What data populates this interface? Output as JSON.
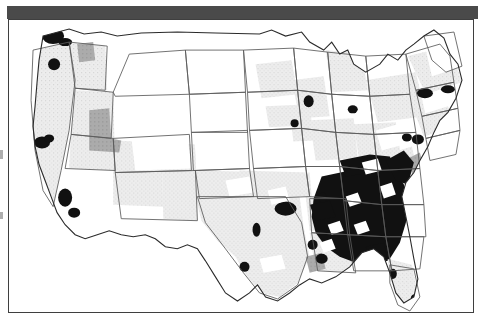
{
  "figure": {
    "kind": "choropleth-map",
    "region": "Contiguous United States",
    "unit": "county",
    "title": "",
    "caption": ""
  },
  "frame": {
    "top_bar_color": "#4a4a4a",
    "border_color": "#3f3f3f",
    "background_color": "#ffffff"
  },
  "chart_data": {
    "type": "heatmap",
    "title": "",
    "xlabel": "",
    "ylabel": "",
    "legend_position": "none",
    "grid": false,
    "projection": "albers-usa",
    "classes": [
      {
        "id": "c0",
        "label": "lowest",
        "color": "#ffffff",
        "rank": 0
      },
      {
        "id": "c1",
        "label": "low",
        "color": "#e3e3e3",
        "rank": 1
      },
      {
        "id": "c2",
        "label": "medium",
        "color": "#a8a8a8",
        "rank": 2
      },
      {
        "id": "c3",
        "label": "high",
        "color": "#111111",
        "rank": 3
      }
    ],
    "state_fill_ranks": {
      "WA": 1,
      "OR": 1,
      "CA": 1,
      "NV": 1,
      "ID": 1,
      "MT": 0,
      "WY": 0,
      "UT": 1,
      "CO": 0,
      "AZ": 1,
      "NM": 1,
      "ND": 0,
      "SD": 0,
      "NE": 0,
      "KS": 0,
      "OK": 1,
      "TX": 1,
      "MN": 1,
      "IA": 0,
      "MO": 1,
      "AR": 1,
      "LA": 1,
      "WI": 1,
      "IL": 1,
      "MS": 1,
      "MI": 1,
      "IN": 1,
      "KY": 1,
      "TN": 2,
      "AL": 3,
      "OH": 1,
      "WV": 1,
      "VA": 2,
      "NC": 2,
      "SC": 3,
      "GA": 3,
      "FL": 1,
      "PA": 1,
      "NY": 1,
      "ME": 0,
      "VT": 1,
      "NH": 1,
      "MA": 1,
      "RI": 1,
      "CT": 1,
      "NJ": 1,
      "DE": 2,
      "MD": 2
    },
    "high_value_clusters": [
      {
        "name": "Puget Sound",
        "x": 46,
        "y": 34,
        "rx": 11,
        "ry": 8
      },
      {
        "name": "Portland",
        "x": 47,
        "y": 63,
        "rx": 6,
        "ry": 6
      },
      {
        "name": "San Francisco Bay",
        "x": 35,
        "y": 141,
        "rx": 8,
        "ry": 6
      },
      {
        "name": "Los Angeles",
        "x": 58,
        "y": 196,
        "rx": 7,
        "ry": 9
      },
      {
        "name": "San Diego",
        "x": 67,
        "y": 211,
        "rx": 6,
        "ry": 5
      },
      {
        "name": "Detroit",
        "x": 301,
        "y": 100,
        "rx": 5,
        "ry": 6
      },
      {
        "name": "Cleveland",
        "x": 345,
        "y": 108,
        "rx": 5,
        "ry": 4
      },
      {
        "name": "Chicago",
        "x": 287,
        "y": 122,
        "rx": 4,
        "ry": 4
      },
      {
        "name": "Philadelphia",
        "x": 410,
        "y": 138,
        "rx": 6,
        "ry": 5
      },
      {
        "name": "Washington DC",
        "x": 399,
        "y": 136,
        "rx": 5,
        "ry": 4
      },
      {
        "name": "New York City",
        "x": 417,
        "y": 92,
        "rx": 8,
        "ry": 5
      },
      {
        "name": "Boston",
        "x": 440,
        "y": 88,
        "rx": 7,
        "ry": 4
      },
      {
        "name": "Dallas-Fort Worth",
        "x": 278,
        "y": 207,
        "rx": 11,
        "ry": 7
      },
      {
        "name": "Houston",
        "x": 237,
        "y": 265,
        "rx": 5,
        "ry": 5
      },
      {
        "name": "Austin",
        "x": 249,
        "y": 228,
        "rx": 4,
        "ry": 7
      },
      {
        "name": "Memphis",
        "x": 315,
        "y": 196,
        "rx": 4,
        "ry": 5
      },
      {
        "name": "New Orleans",
        "x": 314,
        "y": 257,
        "rx": 6,
        "ry": 5
      },
      {
        "name": "Baton Rouge",
        "x": 305,
        "y": 243,
        "rx": 5,
        "ry": 5
      },
      {
        "name": "Tampa",
        "x": 385,
        "y": 272,
        "rx": 4,
        "ry": 5
      },
      {
        "name": "Miami",
        "x": 408,
        "y": 296,
        "rx": 5,
        "ry": 4
      },
      {
        "name": "Black Belt core",
        "x": 355,
        "y": 210,
        "rx": 46,
        "ry": 33
      }
    ],
    "medium_value_clusters": [
      {
        "name": "Eastern Washington",
        "x": 77,
        "y": 35,
        "rx": 7,
        "ry": 5
      },
      {
        "name": "Idaho corridor",
        "x": 90,
        "y": 106,
        "rx": 11,
        "ry": 13
      },
      {
        "name": "Delmarva",
        "x": 407,
        "y": 146,
        "rx": 6,
        "ry": 8
      }
    ]
  },
  "edge_marks": [
    {
      "x": 0,
      "y": 150,
      "w": 3,
      "h": 9
    },
    {
      "x": 0,
      "y": 212,
      "w": 3,
      "h": 7
    }
  ]
}
